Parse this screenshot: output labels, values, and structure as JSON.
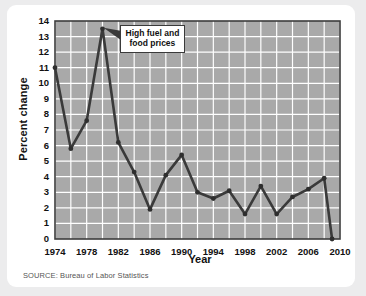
{
  "figure": {
    "y_axis_title": "Percent change",
    "x_axis_title": "Year",
    "source_note": "SOURCE: Bureau of Labor Statistics",
    "annotation_line1": "High fuel and",
    "annotation_line2": "food prices"
  },
  "colors": {
    "page_background": "#ececed",
    "card_background": "#ffffff",
    "plot_background": "#a9a9a9",
    "gridline": "#ffffff",
    "plot_border": "#3c3c3c",
    "line": "#3a3a3a",
    "marker": "#2e2e2e",
    "text": "#111111",
    "source_text": "#555555"
  },
  "chart_data": {
    "type": "line",
    "title": "",
    "xlabel": "Year",
    "ylabel": "Percent change",
    "xlim": [
      1974,
      2010
    ],
    "ylim": [
      0,
      14
    ],
    "grid": true,
    "legend": "none",
    "x_ticks": [
      1974,
      1978,
      1982,
      1986,
      1990,
      1994,
      1998,
      2002,
      2006,
      2010
    ],
    "y_ticks": [
      0,
      1,
      2,
      3,
      4,
      5,
      6,
      7,
      8,
      9,
      10,
      11,
      12,
      13,
      14
    ],
    "x": [
      1974,
      1976,
      1978,
      1980,
      1982,
      1984,
      1986,
      1988,
      1990,
      1992,
      1994,
      1996,
      1998,
      2000,
      2002,
      2004,
      2006,
      2008,
      2009
    ],
    "values": [
      11.0,
      5.8,
      7.6,
      13.5,
      6.2,
      4.3,
      1.9,
      4.1,
      5.4,
      3.0,
      2.6,
      3.1,
      1.6,
      3.4,
      1.6,
      2.7,
      3.2,
      3.9,
      0.0
    ],
    "series": [
      {
        "name": "Consumer price index percent change",
        "values": [
          11.0,
          5.8,
          7.6,
          13.5,
          6.2,
          4.3,
          1.9,
          4.1,
          5.4,
          3.0,
          2.6,
          3.1,
          1.6,
          3.4,
          1.6,
          2.7,
          3.2,
          3.9,
          0.0
        ]
      }
    ],
    "annotations": [
      {
        "text": "High fuel and food prices",
        "x": 1980,
        "y": 13.5
      }
    ]
  }
}
